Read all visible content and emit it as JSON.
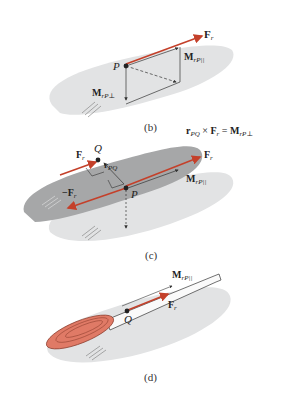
{
  "colors": {
    "plane_light": "#e2e3e4",
    "plane_dark": "#a6a7a8",
    "force_red": "#c4402a",
    "handle_red": "#e07a66",
    "line": "#333333"
  },
  "panels": {
    "b": {
      "caption": "(b)",
      "point_label": "P",
      "force_label": "F",
      "force_sub": "r",
      "moment_parallel_label": "M",
      "moment_parallel_sub": "rP||",
      "moment_perp_label": "M",
      "moment_perp_sub": "rP⊥"
    },
    "c": {
      "caption": "(c)",
      "equation": {
        "r": "r",
        "r_sub": "PQ",
        "times": " × ",
        "f": "F",
        "f_sub": "r",
        "eq": " = ",
        "m": "M",
        "m_sub": "rP⊥"
      },
      "point_q_label": "Q",
      "point_p_label": "P",
      "force_q_label": "F",
      "force_q_sub": "r",
      "force_neg_label": "−F",
      "force_neg_sub": "r",
      "force_right_label": "F",
      "force_right_sub": "r",
      "rpq_label": "r",
      "rpq_sub": "PQ",
      "moment_parallel_label": "M",
      "moment_parallel_sub": "rP||"
    },
    "d": {
      "caption": "(d)",
      "point_label": "Q",
      "force_label": "F",
      "force_sub": "r",
      "moment_parallel_label": "M",
      "moment_parallel_sub": "rP||"
    }
  }
}
